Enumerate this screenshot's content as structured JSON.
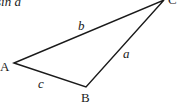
{
  "diagram": {
    "type": "triangle",
    "caption_fragment": "sin a",
    "vertices": [
      {
        "label": "A",
        "x": 14,
        "y": 63
      },
      {
        "label": "B",
        "x": 86,
        "y": 87
      },
      {
        "label": "C",
        "x": 164,
        "y": 0
      }
    ],
    "sides": [
      {
        "label": "a",
        "between": "B-C"
      },
      {
        "label": "b",
        "between": "A-C"
      },
      {
        "label": "c",
        "between": "A-B"
      }
    ],
    "stroke_color": "#1a1a1a"
  }
}
